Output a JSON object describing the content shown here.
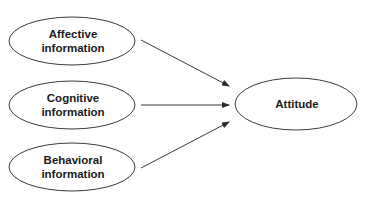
{
  "diagram": {
    "type": "flow",
    "nodes": [
      {
        "id": "affective",
        "label_line1": "Affective",
        "label_line2": "information",
        "cx": 72,
        "cy": 41,
        "rx": 63,
        "ry": 24
      },
      {
        "id": "cognitive",
        "label_line1": "Cognitive",
        "label_line2": "information",
        "cx": 72,
        "cy": 105,
        "rx": 63,
        "ry": 24
      },
      {
        "id": "behavioral",
        "label_line1": "Behavioral",
        "label_line2": "information",
        "cx": 72,
        "cy": 167,
        "rx": 63,
        "ry": 24
      },
      {
        "id": "attitude",
        "label": "Attitude",
        "cx": 296,
        "cy": 104,
        "rx": 61,
        "ry": 26
      }
    ],
    "edges": [
      {
        "from": "affective",
        "to": "attitude"
      },
      {
        "from": "cognitive",
        "to": "attitude"
      },
      {
        "from": "behavioral",
        "to": "attitude"
      }
    ],
    "colors": {
      "stroke": "#3a3a3a",
      "text": "#1a1a1a",
      "background": "#ffffff"
    }
  }
}
